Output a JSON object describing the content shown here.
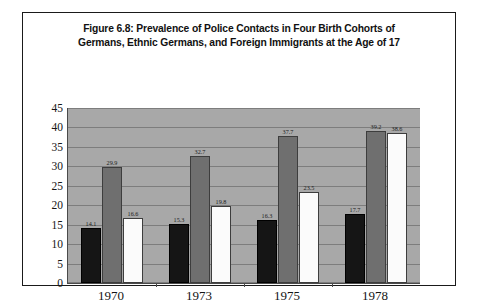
{
  "figure": {
    "title_line_1": "Figure 6.8: Prevalence of Police Contacts in Four Birth Cohorts of",
    "title_line_2": "Germans, Ethnic Germans, and Foreign Immigrants at the Age of 17"
  },
  "chart_data": {
    "type": "bar",
    "title": "Figure 6.8: Prevalence of Police Contacts in Four Birth Cohorts of Germans, Ethnic Germans, and Foreign Immigrants at the Age of 17",
    "xlabel": "",
    "ylabel": "",
    "categories": [
      "1970",
      "1973",
      "1975",
      "1978"
    ],
    "series": [
      {
        "name": "German",
        "color": "#151515",
        "values": [
          14.1,
          15.3,
          16.3,
          17.7
        ]
      },
      {
        "name": "Ethnic German",
        "color": "#6f6f6f",
        "values": [
          29.9,
          32.7,
          37.7,
          39.2
        ]
      },
      {
        "name": "Foreign",
        "color": "#fbfbfb",
        "values": [
          16.6,
          19.8,
          23.5,
          38.6
        ]
      }
    ],
    "ylim": [
      0,
      45
    ],
    "yticks": [
      0,
      5,
      10,
      15,
      20,
      25,
      30,
      35,
      40,
      45
    ],
    "ytick_labels": [
      "0",
      "5",
      "10",
      "15",
      "20",
      "25",
      "30",
      "35",
      "40",
      "45"
    ],
    "grid": true,
    "legend_position": "bottom",
    "plot_background": "#a8a8a8",
    "data_labels": [
      [
        "14.1",
        "29.9",
        "16.6"
      ],
      [
        "15.3",
        "32.7",
        "19.8"
      ],
      [
        "16.3",
        "37.7",
        "23.5"
      ],
      [
        "17.7",
        "39.2",
        "38.6"
      ]
    ]
  }
}
